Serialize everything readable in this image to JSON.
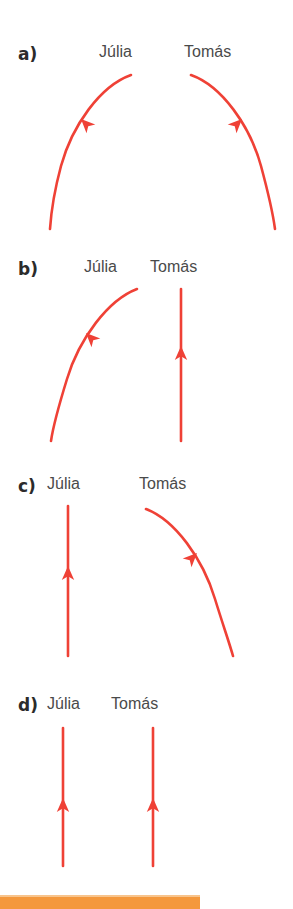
{
  "figure": {
    "background_color": "#ffffff",
    "arrow_color": "#ef4136",
    "label_color": "#4a4a4a",
    "letter_color": "#2b2b2b",
    "accent_bar_color": "#f4983c"
  },
  "panels": [
    {
      "id": "a",
      "letter": "a)",
      "letter_pos": {
        "x": 18,
        "y": 46
      },
      "labels": [
        {
          "name": "julia",
          "text": "Júlia",
          "x": 99,
          "y": 44
        },
        {
          "name": "tomas",
          "text": "Tomás",
          "x": 184,
          "y": 44
        }
      ],
      "arrows": [
        {
          "name": "julia-arrow",
          "shape": "curve-left",
          "path": "M 131 75 C 100 86 72 126 61 166 C 54 192 51 214 50 229",
          "head": {
            "x": 81,
            "y": 119,
            "angle": 225
          }
        },
        {
          "name": "tomas-arrow",
          "shape": "curve-right",
          "path": "M 191 75 C 222 86 250 126 261 166 C 268 192 273 214 275 229",
          "head": {
            "x": 242,
            "y": 119,
            "angle": 315
          }
        }
      ]
    },
    {
      "id": "b",
      "letter": "b)",
      "letter_pos": {
        "x": 18,
        "y": 261
      },
      "labels": [
        {
          "name": "julia",
          "text": "Júlia",
          "x": 84,
          "y": 259
        },
        {
          "name": "tomas",
          "text": "Tomás",
          "x": 150,
          "y": 259
        }
      ],
      "arrows": [
        {
          "name": "julia-arrow",
          "shape": "curve-left",
          "path": "M 137 289 C 108 300 79 339 67 379 C 59 405 53 427 51 441",
          "head": {
            "x": 86,
            "y": 333,
            "angle": 225
          }
        },
        {
          "name": "tomas-arrow",
          "shape": "straight-down",
          "path": "M 181 289 L 181 441",
          "head": {
            "x": 181,
            "y": 346,
            "angle": 270
          }
        }
      ]
    },
    {
      "id": "c",
      "letter": "c)",
      "letter_pos": {
        "x": 18,
        "y": 478
      },
      "labels": [
        {
          "name": "julia",
          "text": "Júlia",
          "x": 47,
          "y": 476
        },
        {
          "name": "tomas",
          "text": "Tomás",
          "x": 139,
          "y": 476
        }
      ],
      "arrows": [
        {
          "name": "julia-arrow",
          "shape": "straight-down",
          "path": "M 68 506 L 68 656",
          "head": {
            "x": 68,
            "y": 566,
            "angle": 270
          }
        },
        {
          "name": "tomas-arrow",
          "shape": "curve-right",
          "path": "M 146 509 C 175 520 203 559 215 599 C 223 625 230 645 233 656",
          "head": {
            "x": 197,
            "y": 553,
            "angle": 315
          }
        }
      ]
    },
    {
      "id": "d",
      "letter": "d)",
      "letter_pos": {
        "x": 18,
        "y": 697
      },
      "labels": [
        {
          "name": "julia",
          "text": "Júlia",
          "x": 47,
          "y": 696
        },
        {
          "name": "tomas",
          "text": "Tomás",
          "x": 111,
          "y": 696
        }
      ],
      "arrows": [
        {
          "name": "julia-arrow",
          "shape": "straight-down",
          "path": "M 63 728 L 63 866",
          "head": {
            "x": 63,
            "y": 798,
            "angle": 270
          }
        },
        {
          "name": "tomas-arrow",
          "shape": "straight-down",
          "path": "M 153 728 L 153 866",
          "head": {
            "x": 153,
            "y": 798,
            "angle": 270
          }
        }
      ]
    }
  ],
  "accent_bar": {
    "name": "page-accent-bar",
    "x": 0,
    "y": 897,
    "width": 200,
    "height": 12
  }
}
